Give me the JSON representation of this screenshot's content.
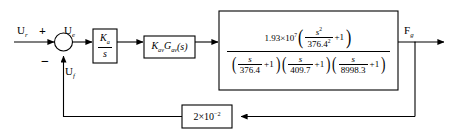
{
  "diagram": {
    "type": "control-system-block-diagram",
    "title": "",
    "line_color": "#000000",
    "background": "#ffffff"
  },
  "signals": {
    "input_label": "U",
    "input_sub": "r",
    "error_label": "U",
    "error_sub": "e",
    "feedback_label": "U",
    "feedback_sub": "f",
    "output_label": "F",
    "output_sub": "g"
  },
  "summing_junction": {
    "name": "summing-junction",
    "plus_sign": "+",
    "minus_sign": "−"
  },
  "blocks": {
    "integrator": {
      "name": "integrator-gain-block",
      "numerator": "K",
      "numerator_sub": "a",
      "denominator": "s"
    },
    "valve": {
      "name": "valve-transfer-block",
      "k_symbol": "K",
      "k_sub": "av",
      "g_symbol": "G",
      "g_sub": "av",
      "argument": "(s)"
    },
    "plant": {
      "name": "plant-transfer-function-block",
      "numerator": {
        "coefficient": "1.93×10",
        "coefficient_exp": "7",
        "inner_num": "s",
        "inner_num_exp": "2",
        "inner_den": "376.4",
        "inner_den_exp": "2",
        "plus_one": "+1"
      },
      "denominator_terms": [
        {
          "num": "s",
          "den": "376.4",
          "plus_one": "+1"
        },
        {
          "num": "s",
          "den": "409.7",
          "plus_one": "+1"
        },
        {
          "num": "s",
          "den": "8998.3",
          "plus_one": "+1"
        }
      ]
    },
    "feedback": {
      "name": "feedback-gain-block",
      "mantissa": "2×10",
      "exponent": "−2"
    }
  }
}
